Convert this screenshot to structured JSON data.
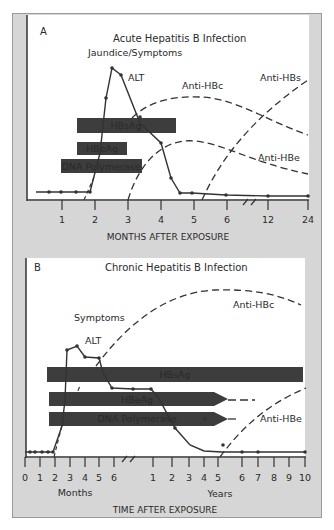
{
  "panelA": {
    "letter": "A",
    "title": "Acute Hepatitis B Infection",
    "labels": {
      "symptoms": "Jaundice/Symptoms",
      "alt": "ALT",
      "anti_hbc": "Anti-HBc",
      "anti_hbs": "Anti-HBs",
      "anti_hbe": "Anti-HBe"
    },
    "bars": [
      {
        "label": "HBsAg"
      },
      {
        "label": "HBeAg"
      },
      {
        "label": "DNA Polymerase"
      }
    ],
    "ticks": [
      "1",
      "2",
      "3",
      "4",
      "5",
      "6",
      "12",
      "24"
    ],
    "xlabel": "MONTHS AFTER EXPOSURE"
  },
  "panelB": {
    "letter": "B",
    "title": "Chronic Hepatitis B Infection",
    "labels": {
      "symptoms": "Symptoms",
      "alt": "ALT",
      "anti_hbc": "Anti-HBc",
      "anti_hbe": "Anti-HBe"
    },
    "bars": [
      {
        "label": "HBsAg"
      },
      {
        "label": "HBeAg"
      },
      {
        "label": "DNA Polymerase"
      }
    ],
    "month_ticks": [
      "0",
      "1",
      "2",
      "3",
      "4",
      "5",
      "6"
    ],
    "year_ticks": [
      "1",
      "2",
      "3",
      "4",
      "5",
      "6",
      "7",
      "8",
      "9",
      "10"
    ],
    "months_label": "Months",
    "years_label": "Years",
    "xlabel": "TIME AFTER EXPOSURE"
  },
  "colors": {
    "frame": "#d6d6d6",
    "panel": "#ffffff",
    "bar": "#3d3d3d",
    "bar_text": "#e6e6e6",
    "line": "#333333"
  }
}
